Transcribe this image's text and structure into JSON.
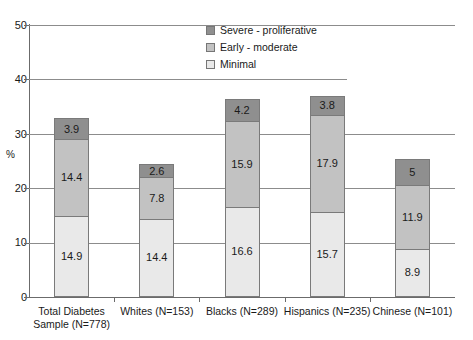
{
  "chart_data": {
    "type": "bar",
    "subtype": "stacked-bar",
    "title": "",
    "xlabel": "",
    "ylabel": "%",
    "ylim": [
      0,
      50
    ],
    "yticks": [
      0,
      10,
      20,
      30,
      40,
      50
    ],
    "grid": true,
    "legend_position": "top-center",
    "categories": [
      "Total Diabetes Sample (N=778)",
      "Whites (N=153)",
      "Blacks (N=289)",
      "Hispanics (N=235)",
      "Chinese (N=101)"
    ],
    "category_lines": [
      [
        "Total Diabetes",
        "Sample (N=778)"
      ],
      [
        "Whites (N=153)"
      ],
      [
        "Blacks (N=289)"
      ],
      [
        "Hispanics (N=235)"
      ],
      [
        "Chinese (N=101)"
      ]
    ],
    "series": [
      {
        "name": "Minimal",
        "color": "#e9e9e9",
        "values": [
          14.9,
          14.4,
          16.6,
          15.7,
          8.9
        ],
        "labels": [
          "14.9",
          "14.4",
          "16.6",
          "15.7",
          "8.9"
        ]
      },
      {
        "name": "Early - moderate",
        "color": "#c2c2c2",
        "values": [
          14.4,
          7.8,
          15.9,
          17.9,
          11.9
        ],
        "labels": [
          "14.4",
          "7.8",
          "15.9",
          "17.9",
          "11.9"
        ]
      },
      {
        "name": "Severe - proliferative",
        "color": "#8f8f8f",
        "values": [
          3.9,
          2.6,
          4.2,
          3.8,
          5
        ],
        "labels": [
          "3.9",
          "2.6",
          "4.2",
          "3.8",
          "5"
        ]
      }
    ],
    "totals": [
      33.2,
      24.8,
      36.7,
      37.4,
      25.8
    ]
  },
  "legend": {
    "items": [
      {
        "label": "Severe - proliferative"
      },
      {
        "label": "Early - moderate"
      },
      {
        "label": "Minimal"
      }
    ]
  },
  "axis": {
    "y_title": "%",
    "y_labels": [
      "50",
      "40",
      "30",
      "20",
      "10",
      "0"
    ]
  }
}
